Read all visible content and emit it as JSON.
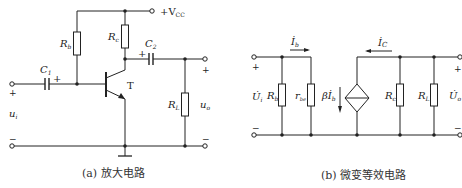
{
  "circuit_a": {
    "caption": "(a) 放大电路",
    "supply_label": "+V",
    "supply_sub": "CC",
    "components": {
      "Rb": {
        "main": "R",
        "sub": "b"
      },
      "Rc": {
        "main": "R",
        "sub": "c"
      },
      "C1": {
        "main": "C",
        "sub": "1"
      },
      "C2": {
        "main": "C",
        "sub": "2"
      },
      "RL": {
        "main": "R",
        "sub": "L"
      },
      "T": "T"
    },
    "input": {
      "main": "u",
      "sub": "i",
      "plus": "+",
      "minus": "−"
    },
    "output": {
      "main": "u",
      "sub": "o",
      "plus": "+",
      "minus": "−"
    },
    "cap_polarity": "+"
  },
  "circuit_b": {
    "caption": "(b) 微变等效电路",
    "components": {
      "Rb": {
        "main": "R",
        "sub": "b"
      },
      "rbe": {
        "main": "r",
        "sub": "be"
      },
      "source": {
        "beta": "β",
        "main": "İ",
        "sub": "b"
      },
      "Rc": {
        "main": "R",
        "sub": "c"
      },
      "RL": {
        "main": "R",
        "sub": "L"
      }
    },
    "currents": {
      "Ib": {
        "main": "İ",
        "sub": "b"
      },
      "Ic": {
        "main": "İ",
        "sub": "C"
      }
    },
    "input": {
      "main": "U̇",
      "sub": "i",
      "plus": "+",
      "minus": "−"
    },
    "output": {
      "main": "U̇",
      "sub": "o",
      "plus": "+",
      "minus": "−"
    }
  }
}
